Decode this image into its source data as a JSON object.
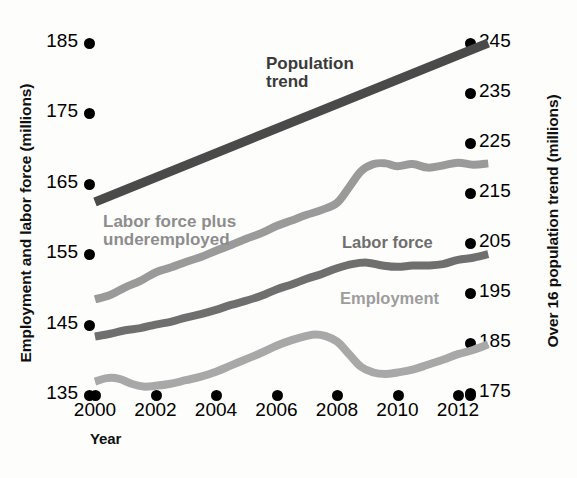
{
  "chart_data": {
    "type": "line",
    "title": "",
    "xlabel": "Year",
    "ylabel": "Employment and labor force (millions)",
    "y2label": "Over 16 population trend (millions)",
    "grid": false,
    "legend_position": "inline-annotations",
    "xlim": [
      2000,
      2013
    ],
    "ylim": [
      132,
      188
    ],
    "y2lim": [
      172,
      248
    ],
    "xticks": [
      "2000",
      "2002",
      "2004",
      "2006",
      "2008",
      "2010",
      "2012"
    ],
    "xtick_values": [
      2000,
      2002,
      2004,
      2006,
      2008,
      2010,
      2012
    ],
    "yticks": [
      "185",
      "175",
      "165",
      "155",
      "145",
      "135"
    ],
    "ytick_values": [
      185,
      175,
      165,
      155,
      145,
      135
    ],
    "y2ticks": [
      "245",
      "235",
      "225",
      "215",
      "205",
      "195",
      "185",
      "175"
    ],
    "y2tick_values": [
      245,
      235,
      225,
      215,
      205,
      195,
      185,
      175
    ],
    "series": [
      {
        "name": "Population trend",
        "axis": "right",
        "color": "#4a4a4a",
        "x": [
          2000,
          2013
        ],
        "values": [
          213.2,
          245.0
        ]
      },
      {
        "name": "Labor force plus underemployed",
        "axis": "left",
        "color": "#9a9a9a",
        "x": [
          2000,
          2000.5,
          2001,
          2001.5,
          2002,
          2002.5,
          2003,
          2003.5,
          2004,
          2004.5,
          2005,
          2005.5,
          2006,
          2006.5,
          2007,
          2007.5,
          2008,
          2008.4,
          2008.8,
          2009.2,
          2009.6,
          2010,
          2010.5,
          2011,
          2011.5,
          2012,
          2012.5,
          2013
        ],
        "values": [
          148.6,
          149.2,
          150.3,
          151.2,
          152.4,
          153.1,
          153.9,
          154.6,
          155.5,
          156.3,
          157.2,
          158.0,
          159.0,
          159.8,
          160.6,
          161.3,
          162.3,
          164.5,
          166.8,
          167.8,
          167.9,
          167.5,
          167.8,
          167.3,
          167.6,
          168.0,
          167.7,
          167.9
        ]
      },
      {
        "name": "Labor force",
        "axis": "left",
        "color": "#6f6f6f",
        "x": [
          2000,
          2000.5,
          2001,
          2001.5,
          2002,
          2002.5,
          2003,
          2003.5,
          2004,
          2004.5,
          2005,
          2005.5,
          2006,
          2006.5,
          2007,
          2007.5,
          2008,
          2008.5,
          2009,
          2009.5,
          2010,
          2010.5,
          2011,
          2011.5,
          2012,
          2012.5,
          2013
        ],
        "values": [
          143.3,
          143.7,
          144.2,
          144.5,
          145.0,
          145.4,
          146.0,
          146.5,
          147.1,
          147.8,
          148.4,
          149.1,
          150.0,
          150.7,
          151.5,
          152.2,
          153.0,
          153.6,
          153.8,
          153.4,
          153.2,
          153.4,
          153.4,
          153.6,
          154.2,
          154.5,
          155.0
        ]
      },
      {
        "name": "Employment",
        "axis": "left",
        "color": "#a8a8a8",
        "x": [
          2000,
          2000.4,
          2000.8,
          2001.2,
          2001.6,
          2002,
          2002.5,
          2003,
          2003.5,
          2004,
          2004.5,
          2005,
          2005.5,
          2006,
          2006.5,
          2007,
          2007.3,
          2007.6,
          2008,
          2008.4,
          2008.8,
          2009.2,
          2009.6,
          2010,
          2010.5,
          2011,
          2011.5,
          2012,
          2012.5,
          2013
        ],
        "values": [
          136.9,
          137.4,
          137.3,
          136.6,
          136.2,
          136.3,
          136.6,
          137.1,
          137.6,
          138.3,
          139.2,
          140.1,
          141.0,
          142.0,
          142.8,
          143.4,
          143.6,
          143.4,
          142.6,
          140.8,
          139.0,
          138.2,
          138.0,
          138.2,
          138.6,
          139.3,
          140.0,
          140.8,
          141.4,
          142.2
        ]
      }
    ],
    "annotations": [
      {
        "text": "Population\ntrend",
        "color": "#3a3a3a"
      },
      {
        "text": "Labor force plus\nunderemployed",
        "color": "#8d8d8d"
      },
      {
        "text": "Labor force",
        "color": "#6e6e6e"
      },
      {
        "text": "Employment",
        "color": "#9d9d9d"
      }
    ]
  },
  "axes": {
    "left_title": "Employment and labor force (millions)",
    "right_title": "Over 16 population trend (millions)",
    "x_title": "Year"
  },
  "labels": {
    "population_trend": "Population\ntrend",
    "labor_force_plus": "Labor force plus\nunderemployed",
    "labor_force": "Labor force",
    "employment": "Employment"
  }
}
